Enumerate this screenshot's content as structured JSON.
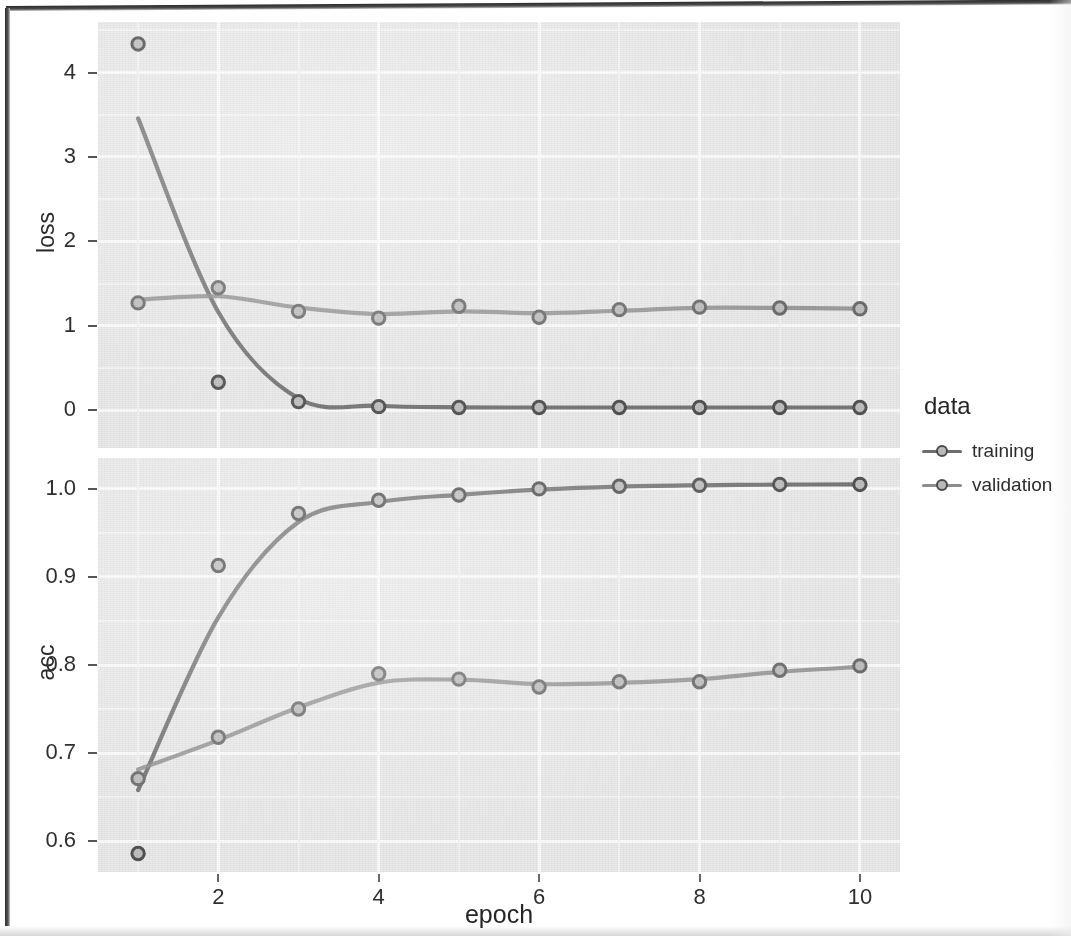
{
  "figure": {
    "x_axis_title": "epoch",
    "panels": [
      {
        "id": "loss",
        "y_axis_title": "loss"
      },
      {
        "id": "acc",
        "y_axis_title": "acc"
      }
    ]
  },
  "legend": {
    "title": "data",
    "items": [
      {
        "label": "training",
        "color": "#6e6e6e"
      },
      {
        "label": "validation",
        "color": "#8c8c8c"
      }
    ]
  },
  "axes": {
    "x_ticks": [
      "2",
      "4",
      "6",
      "8",
      "10"
    ],
    "loss_y_ticks": [
      "0",
      "1",
      "2",
      "3",
      "4"
    ],
    "acc_y_ticks": [
      "0.6",
      "0.7",
      "0.8",
      "0.9",
      "1.0"
    ]
  },
  "chart_data": [
    {
      "type": "line",
      "title": "loss",
      "xlabel": "epoch",
      "ylabel": "loss",
      "x": [
        1,
        2,
        3,
        4,
        5,
        6,
        7,
        8,
        9,
        10
      ],
      "xlim": [
        0.5,
        10.5
      ],
      "ylim": [
        -0.45,
        4.6
      ],
      "grid": true,
      "legend_position": "right",
      "series": [
        {
          "name": "training",
          "color": "#6e6e6e",
          "values": [
            4.34,
            0.33,
            0.1,
            0.04,
            0.03,
            0.03,
            0.03,
            0.03,
            0.03,
            0.03
          ]
        },
        {
          "name": "validation",
          "color": "#8c8c8c",
          "values": [
            1.27,
            1.45,
            1.17,
            1.09,
            1.23,
            1.1,
            1.19,
            1.22,
            1.21,
            1.2
          ]
        }
      ]
    },
    {
      "type": "line",
      "title": "acc",
      "xlabel": "epoch",
      "ylabel": "acc",
      "x": [
        1,
        2,
        3,
        4,
        5,
        6,
        7,
        8,
        9,
        10
      ],
      "xlim": [
        0.5,
        10.5
      ],
      "ylim": [
        0.565,
        1.035
      ],
      "grid": true,
      "legend_position": "right",
      "series": [
        {
          "name": "training",
          "color": "#6e6e6e",
          "values": [
            0.586,
            0.913,
            0.972,
            0.987,
            0.993,
            1.0,
            1.003,
            1.004,
            1.005,
            1.005
          ]
        },
        {
          "name": "validation",
          "color": "#8c8c8c",
          "values": [
            0.671,
            0.718,
            0.75,
            0.79,
            0.784,
            0.775,
            0.781,
            0.781,
            0.794,
            0.799
          ]
        }
      ]
    }
  ]
}
